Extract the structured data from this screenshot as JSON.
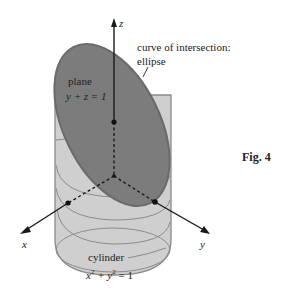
{
  "figure": {
    "caption": "Fig. 4",
    "annotation_curve": {
      "line1": "curve of intersection:",
      "line2": "ellipse"
    },
    "plane": {
      "name": "plane",
      "equation": "y + z = 1"
    },
    "cylinder": {
      "name": "cylinder",
      "equation_x": "x",
      "equation_y": " + y",
      "equation_rest": " = 1",
      "sup": "2"
    },
    "axes": {
      "x": "x",
      "y": "y",
      "z": "z"
    },
    "colors": {
      "plane_fill": "#7a7a7a",
      "plane_edge": "#6a6a6a",
      "cylinder_fill": "#cfcfcf",
      "cylinder_edge": "#8a8a8a",
      "axis": "#1a1a1a",
      "background": "#ffffff"
    }
  }
}
